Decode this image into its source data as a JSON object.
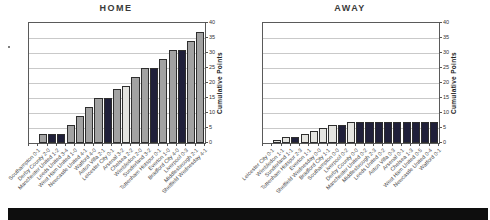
{
  "ui": {
    "left_chart_title": "HOME",
    "right_chart_title": "AWAY",
    "y_axis_title": "Cumulative Points"
  },
  "chart_data": [
    {
      "type": "bar",
      "title": "HOME",
      "ylabel": "Cumulative Points",
      "ylim": [
        0,
        40
      ],
      "yticks": [
        0,
        5,
        10,
        15,
        20,
        25,
        30,
        35,
        40
      ],
      "grid": true,
      "legend": "none",
      "categories": [
        "Southampton  0-1",
        "Derby County  2-0",
        "Manchester United  1-2",
        "Leeds United  3-4",
        "West Ham United  1-0",
        "Newcastle United  4-1",
        "Watford  4-0",
        "Aston Villa  2-1",
        "Leicester City  0-1",
        "Arsenal  3-2",
        "Chelsea  2-2",
        "Wimbledon  2-0",
        "Sunderland  3-2",
        "Tottenham Hotspur  0-1",
        "Everton  1-0",
        "Bradford City  4-0",
        "Liverpool  0-3",
        "Middlesbrough  2-1",
        "Sheffield Wednesday  4-1"
      ],
      "values": [
        0,
        3,
        3,
        3,
        6,
        9,
        12,
        15,
        15,
        18,
        19,
        22,
        25,
        25,
        28,
        31,
        31,
        34,
        37
      ],
      "results": [
        "L",
        "W",
        "L",
        "L",
        "W",
        "W",
        "W",
        "W",
        "L",
        "W",
        "D",
        "W",
        "W",
        "L",
        "W",
        "W",
        "L",
        "W",
        "W"
      ]
    },
    {
      "type": "bar",
      "title": "AWAY",
      "ylabel": "Cumulative Points",
      "ylim": [
        0,
        40
      ],
      "yticks": [
        0,
        5,
        10,
        15,
        20,
        25,
        30,
        35,
        40
      ],
      "grid": true,
      "legend": "none",
      "categories": [
        "Leicester City  0-1",
        "Wimbledon  1-1",
        "Sunderland  1-1",
        "Tottenham Hotspur  2-3",
        "Everton  1-1",
        "Sheffield Wednesday  0-0",
        "Bradford City  1-1",
        "Southampton  0-0",
        "Liverpool  0-2",
        "Derby County  0-0",
        "Manchester United  0-2",
        "Middlesbrough  2-3",
        "Leeds United  0-2",
        "Aston Villa  0-3",
        "Arsenal  0-1",
        "Chelsea  1-3",
        "West Ham United  0-5",
        "Newcastle United  0-4",
        "Watford  0-1"
      ],
      "values": [
        0,
        1,
        2,
        2,
        3,
        4,
        5,
        6,
        6,
        7,
        7,
        7,
        7,
        7,
        7,
        7,
        7,
        7,
        7
      ],
      "results": [
        "L",
        "D",
        "D",
        "L",
        "D",
        "D",
        "D",
        "D",
        "L",
        "D",
        "L",
        "L",
        "L",
        "L",
        "L",
        "L",
        "L",
        "L",
        "L"
      ]
    }
  ],
  "bar_colors": {
    "W": "#a2a2a2",
    "D": "#e4e4e0",
    "L": "#20203a"
  }
}
